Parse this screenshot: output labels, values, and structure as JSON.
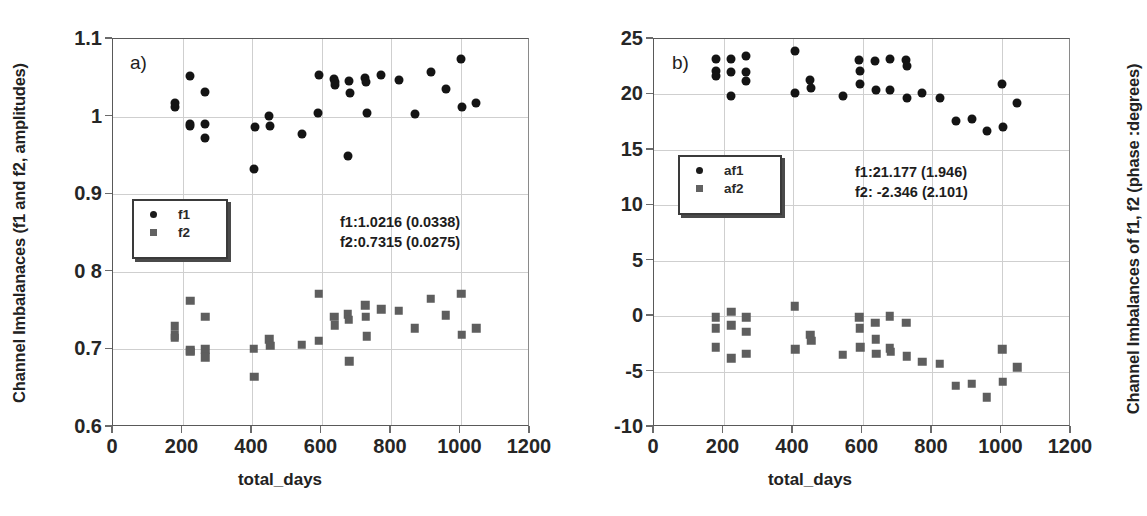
{
  "figure": {
    "width": 1120,
    "height": 516,
    "background": "#ffffff",
    "series_colors": {
      "f1": "#141414",
      "f2": "#5e5e5e"
    }
  },
  "panels": [
    {
      "tag": "a)",
      "ylabel": "Channel Imbalanaces (f1 and f2, amplitudes)",
      "xlabel": "total_days",
      "annotation": "f1:1.0216 (0.0338)\nf2:0.7315 (0.0275)",
      "legend": {
        "items": [
          {
            "label": "f1",
            "marker": "circle-marker"
          },
          {
            "label": "f2",
            "marker": "square-marker"
          }
        ]
      },
      "yticks": [
        "1.1",
        "1",
        "0.9",
        "0 8",
        "0.7",
        "0.6"
      ],
      "xticks": [
        "0",
        "200",
        "400",
        "600",
        "800",
        "1000",
        "1200"
      ]
    },
    {
      "tag": "b)",
      "ylabel": "Channel Imbalances of f1, f2 (phase :degrees)",
      "xlabel": "total_days",
      "annotation": "f1:21.177 (1.946)\nf2: -2.346 (2.101)",
      "legend": {
        "items": [
          {
            "label": "af1",
            "marker": "circle-marker"
          },
          {
            "label": "af2",
            "marker": "square-marker"
          }
        ]
      },
      "yticks": [
        "25",
        "20",
        "15",
        "10",
        "5",
        "0",
        "-5",
        "-10"
      ],
      "xticks": [
        "0",
        "200",
        "400",
        "600",
        "800",
        "1000",
        "1200"
      ]
    }
  ],
  "chart_data": [
    {
      "type": "scatter",
      "panel": "a",
      "title": "a) Channel Imbalanaces (f1 and f2, amplitudes)",
      "xlabel": "total_days",
      "ylabel": "Channel Imbalanaces (f1 and f2, amplitudes)",
      "xlim": [
        0,
        1200
      ],
      "ylim": [
        0.6,
        1.1
      ],
      "xticks": [
        0,
        200,
        400,
        600,
        800,
        1000,
        1200
      ],
      "yticks": [
        0.6,
        0.7,
        0.8,
        0.9,
        1.0,
        1.1
      ],
      "grid": true,
      "legend_position": "center-left",
      "annotations": [
        "f1:1.0216 (0.0338)",
        "f2:0.7315 (0.0275)"
      ],
      "statistics": {
        "f1": {
          "mean": 1.0216,
          "std": 0.0338
        },
        "f2": {
          "mean": 0.7315,
          "std": 0.0275
        }
      },
      "series": [
        {
          "name": "f1",
          "marker": "circle",
          "color": "#141414",
          "points": [
            [
              178,
              1.012
            ],
            [
              178,
              1.018
            ],
            [
              222,
              1.052
            ],
            [
              222,
              0.988
            ],
            [
              222,
              0.991
            ],
            [
              265,
              1.032
            ],
            [
              265,
              0.991
            ],
            [
              265,
              0.973
            ],
            [
              405,
              0.933
            ],
            [
              408,
              0.987
            ],
            [
              448,
              1.001
            ],
            [
              452,
              0.988
            ],
            [
              543,
              0.977
            ],
            [
              590,
              1.005
            ],
            [
              592,
              1.053
            ],
            [
              637,
              1.049
            ],
            [
              638,
              1.041
            ],
            [
              640,
              1.044
            ],
            [
              676,
              0.949
            ],
            [
              678,
              1.046
            ],
            [
              682,
              1.03
            ],
            [
              726,
              1.05
            ],
            [
              728,
              1.044
            ],
            [
              730,
              1.005
            ],
            [
              772,
              1.053
            ],
            [
              822,
              1.047
            ],
            [
              868,
              1.003
            ],
            [
              914,
              1.057
            ],
            [
              958,
              1.036
            ],
            [
              1002,
              1.074
            ],
            [
              1004,
              1.013
            ],
            [
              1046,
              1.017
            ]
          ]
        },
        {
          "name": "f2",
          "marker": "square",
          "color": "#5e5e5e",
          "points": [
            [
              178,
              0.73
            ],
            [
              178,
              0.718
            ],
            [
              178,
              0.715
            ],
            [
              222,
              0.763
            ],
            [
              222,
              0.699
            ],
            [
              222,
              0.697
            ],
            [
              265,
              0.742
            ],
            [
              265,
              0.7
            ],
            [
              265,
              0.69
            ],
            [
              405,
              0.701
            ],
            [
              407,
              0.665
            ],
            [
              450,
              0.713
            ],
            [
              452,
              0.705
            ],
            [
              543,
              0.706
            ],
            [
              592,
              0.711
            ],
            [
              592,
              0.772
            ],
            [
              637,
              0.742
            ],
            [
              638,
              0.731
            ],
            [
              676,
              0.745
            ],
            [
              678,
              0.738
            ],
            [
              680,
              0.685
            ],
            [
              726,
              0.757
            ],
            [
              728,
              0.742
            ],
            [
              730,
              0.717
            ],
            [
              772,
              0.752
            ],
            [
              822,
              0.75
            ],
            [
              868,
              0.727
            ],
            [
              914,
              0.765
            ],
            [
              958,
              0.744
            ],
            [
              1002,
              0.772
            ],
            [
              1004,
              0.719
            ],
            [
              1046,
              0.727
            ]
          ]
        }
      ]
    },
    {
      "type": "scatter",
      "panel": "b",
      "title": "b) Channel Imbalances of f1, f2 (phase :degrees)",
      "xlabel": "total_days",
      "ylabel": "Channel Imbalances of f1, f2 (phase :degrees)",
      "xlim": [
        0,
        1200
      ],
      "ylim": [
        -10,
        25
      ],
      "xticks": [
        0,
        200,
        400,
        600,
        800,
        1000,
        1200
      ],
      "yticks": [
        -10,
        -5,
        0,
        5,
        10,
        15,
        20,
        25
      ],
      "grid": true,
      "legend_position": "center-left",
      "annotations": [
        "f1:21.177 (1.946)",
        "f2: -2.346 (2.101)"
      ],
      "statistics": {
        "af1": {
          "mean": 21.177,
          "std": 1.946
        },
        "af2": {
          "mean": -2.346,
          "std": 2.101
        }
      },
      "series": [
        {
          "name": "af1",
          "marker": "circle",
          "color": "#141414",
          "points": [
            [
              178,
              23.2
            ],
            [
              178,
              22.1
            ],
            [
              178,
              21.7
            ],
            [
              222,
              23.2
            ],
            [
              222,
              22.0
            ],
            [
              222,
              19.9
            ],
            [
              265,
              23.5
            ],
            [
              265,
              22.0
            ],
            [
              265,
              21.2
            ],
            [
              405,
              23.9
            ],
            [
              407,
              20.1
            ],
            [
              450,
              21.3
            ],
            [
              452,
              20.6
            ],
            [
              543,
              19.9
            ],
            [
              590,
              23.1
            ],
            [
              592,
              22.1
            ],
            [
              594,
              20.9
            ],
            [
              637,
              23.0
            ],
            [
              639,
              20.4
            ],
            [
              678,
              23.2
            ],
            [
              680,
              20.4
            ],
            [
              726,
              23.1
            ],
            [
              727,
              22.6
            ],
            [
              729,
              19.7
            ],
            [
              772,
              20.1
            ],
            [
              822,
              19.7
            ],
            [
              868,
              17.6
            ],
            [
              914,
              17.8
            ],
            [
              958,
              16.7
            ],
            [
              1002,
              20.9
            ],
            [
              1004,
              17.1
            ],
            [
              1046,
              19.2
            ]
          ]
        },
        {
          "name": "af2",
          "marker": "square",
          "color": "#5e5e5e",
          "points": [
            [
              178,
              -0.1
            ],
            [
              178,
              -1.1
            ],
            [
              178,
              -2.8
            ],
            [
              222,
              0.4
            ],
            [
              222,
              -0.8
            ],
            [
              222,
              -3.8
            ],
            [
              265,
              -0.1
            ],
            [
              265,
              -1.4
            ],
            [
              265,
              -3.4
            ],
            [
              405,
              0.9
            ],
            [
              407,
              -3.0
            ],
            [
              450,
              -1.7
            ],
            [
              452,
              -2.2
            ],
            [
              543,
              -3.5
            ],
            [
              590,
              -0.1
            ],
            [
              592,
              -1.1
            ],
            [
              594,
              -2.8
            ],
            [
              637,
              -0.6
            ],
            [
              638,
              -2.1
            ],
            [
              640,
              -3.4
            ],
            [
              678,
              0.0
            ],
            [
              679,
              -2.9
            ],
            [
              681,
              -3.2
            ],
            [
              726,
              -0.6
            ],
            [
              728,
              -3.6
            ],
            [
              772,
              -4.1
            ],
            [
              822,
              -4.3
            ],
            [
              868,
              -6.3
            ],
            [
              914,
              -6.1
            ],
            [
              958,
              -7.3
            ],
            [
              1002,
              -3.0
            ],
            [
              1004,
              -5.9
            ],
            [
              1046,
              -4.6
            ]
          ]
        }
      ]
    }
  ]
}
